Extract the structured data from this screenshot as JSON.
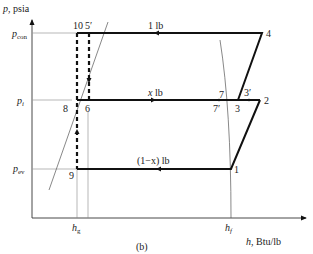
{
  "figure": {
    "caption": "(b)",
    "y_axis_label": "p, psia",
    "x_axis_label": "h, Btu/lb",
    "pressure_levels": {
      "p_con": "p",
      "p_con_sub": "con",
      "p_i": "p",
      "p_i_sub": "i",
      "p_ev": "p",
      "p_ev_sub": "ev"
    },
    "enthalpy_marks": {
      "h_g": "h",
      "h_g_sub": "g",
      "h_f": "h",
      "h_f_sub": "f"
    },
    "flow_labels": {
      "high": "1 lb",
      "mid_x": "x",
      "mid_unit": " lb",
      "low": "(1−x) lb"
    },
    "state_points": {
      "p1": "1",
      "p2": "2",
      "p3": "3",
      "p3prime": "3′",
      "p4": "4",
      "p5prime": "5′",
      "p6": "6",
      "p7": "7",
      "p7prime": "7′",
      "p8": "8",
      "p9": "9",
      "p10": "10"
    },
    "colors": {
      "cycle_line": "#111111",
      "thin_line": "#777777",
      "text": "#222222"
    }
  }
}
